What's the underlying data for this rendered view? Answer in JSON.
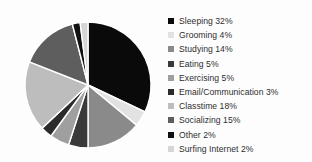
{
  "chart_data": {
    "type": "pie",
    "title": "",
    "subtitle": "",
    "xlabel": "",
    "ylabel": "",
    "grid": false,
    "legend_position": "right",
    "start_angle_deg": 0,
    "direction": "clockwise",
    "units": "percent",
    "total": 100,
    "categories": [
      "Sleeping",
      "Grooming",
      "Studying",
      "Eating",
      "Exercising",
      "Email/Communication",
      "Classtime",
      "Socializing",
      "Other",
      "Surfing Internet"
    ],
    "values": [
      32,
      4,
      14,
      5,
      5,
      3,
      18,
      15,
      2,
      2
    ],
    "colors": [
      "#0a0a0a",
      "#e2e2e2",
      "#8a8a8a",
      "#3a3a3a",
      "#9f9f9f",
      "#2b2b2b",
      "#bdbdbd",
      "#5e5e5e",
      "#101010",
      "#d6d6d6"
    ],
    "slice_separator_color": "#ffffff",
    "slices": [
      {
        "label": "Sleeping",
        "value": 32,
        "display": "Sleeping 32%",
        "color": "#0a0a0a"
      },
      {
        "label": "Grooming",
        "value": 4,
        "display": "Grooming 4%",
        "color": "#e2e2e2"
      },
      {
        "label": "Studying",
        "value": 14,
        "display": "Studying 14%",
        "color": "#8a8a8a"
      },
      {
        "label": "Eating",
        "value": 5,
        "display": "Eating 5%",
        "color": "#3a3a3a"
      },
      {
        "label": "Exercising",
        "value": 5,
        "display": "Exercising 5%",
        "color": "#9f9f9f"
      },
      {
        "label": "Email/Communication",
        "value": 3,
        "display": "Email/Communication 3%",
        "color": "#2b2b2b"
      },
      {
        "label": "Classtime",
        "value": 18,
        "display": "Classtime 18%",
        "color": "#bdbdbd"
      },
      {
        "label": "Socializing",
        "value": 15,
        "display": "Socializing 15%",
        "color": "#5e5e5e"
      },
      {
        "label": "Other",
        "value": 2,
        "display": "Other 2%",
        "color": "#101010"
      },
      {
        "label": "Surfing Internet",
        "value": 2,
        "display": "Surfing Internet 2%",
        "color": "#d6d6d6"
      }
    ]
  },
  "geometry": {
    "center_x": 88,
    "center_y": 85,
    "radius": 63
  },
  "legend": {
    "entries": [
      {
        "text": "Sleeping 32%"
      },
      {
        "text": "Grooming 4%"
      },
      {
        "text": "Studying 14%"
      },
      {
        "text": "Eating 5%"
      },
      {
        "text": "Exercising 5%"
      },
      {
        "text": "Email/Communication 3%"
      },
      {
        "text": "Classtime 18%"
      },
      {
        "text": "Socializing 15%"
      },
      {
        "text": "Other 2%"
      },
      {
        "text": "Surfing Internet 2%"
      }
    ]
  }
}
